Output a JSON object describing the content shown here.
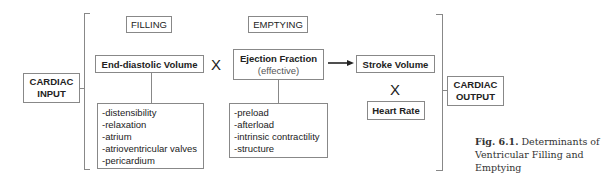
{
  "diagram": {
    "input_label": [
      "CARDIAC",
      "INPUT"
    ],
    "output_label": [
      "CARDIAC",
      "OUTPUT"
    ],
    "filling": {
      "header": "FILLING",
      "node": "End-diastolic Volume",
      "factors": [
        "-distensibility",
        "-relaxation",
        "-atrium",
        "-atrioventricular valves",
        "-pericardium"
      ]
    },
    "multiply_symbol": "X",
    "emptying": {
      "header": "EMPTYING",
      "node": "Ejection Fraction",
      "node_sub": "(effective)",
      "factors": [
        "-preload",
        "-afterload",
        "-intrinsic contractility",
        "-structure"
      ]
    },
    "stroke_volume": "Stroke Volume",
    "heart_rate": "Heart Rate",
    "arrow": "→"
  },
  "caption": {
    "label": "Fig. 6.1.",
    "text_line1": "Determinants of",
    "text_line2": "Ventricular Filling and",
    "text_line3": "Emptying"
  }
}
